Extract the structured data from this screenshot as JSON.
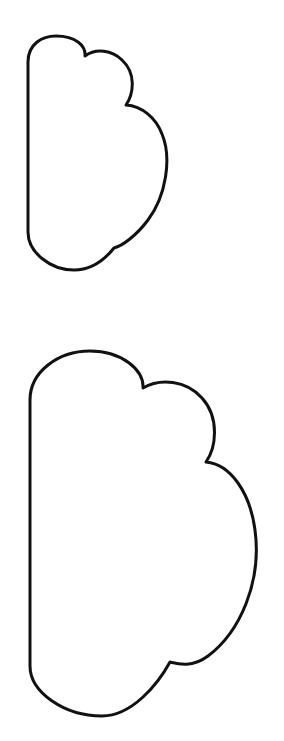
{
  "canvas": {
    "width": 284,
    "height": 741,
    "background_color": "#ffffff",
    "description": "Two black-outline half-cloud / scalloped shapes on a plain white background, stacked vertically"
  },
  "style": {
    "stroke_color": "#111111",
    "fill_color": "#ffffff",
    "stroke_width_small": 3,
    "stroke_width_large": 3
  },
  "shapes": [
    {
      "id": "cloud-small",
      "name": "small-cloud-outline",
      "order": 1,
      "bounds": {
        "x": 27,
        "y": 36,
        "width": 142,
        "height": 235
      },
      "lobes": 3,
      "flat_edge": "left",
      "path": "M 28 62 C 28 44 42 36 56 36 C 76 36 86 46 85 56 C 96 48 112 50 122 60 C 136 73 134 93 126 105 C 142 106 156 118 162 134 C 172 158 166 196 148 220 C 136 236 122 246 114 248 C 106 258 92 270 74 270 C 50 270 28 252 28 232 Z"
    },
    {
      "id": "cloud-large",
      "name": "large-cloud-outline",
      "order": 2,
      "bounds": {
        "x": 29,
        "y": 351,
        "width": 228,
        "height": 367
      },
      "lobes": 3,
      "flat_edge": "left",
      "path": "M 30 400 C 30 372 58 351 90 351 C 122 351 144 370 143 388 C 160 378 186 380 202 398 C 220 418 216 448 206 462 C 230 464 250 492 255 530 C 262 582 240 632 208 656 C 192 668 178 664 170 662 C 158 684 132 716 102 716 C 64 716 30 692 30 666 Z"
    }
  ]
}
